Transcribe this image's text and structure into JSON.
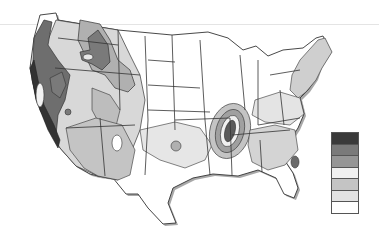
{
  "map": {
    "title": "",
    "subject": "Contiguous United States shaded hazard zones",
    "colors": {
      "zone7": "#3a3a3a",
      "zone6": "#7a7a7a",
      "zone5": "#969696",
      "zone4": "#f0f0f0",
      "zone3": "#c4c4c4",
      "zone2": "#e2e2e2",
      "zone1": "#ffffff",
      "outline": "#333333",
      "shadow": "#9a9a9a"
    }
  },
  "legend": {
    "swatches": [
      {
        "zone": "zone7",
        "color": "#3a3a3a"
      },
      {
        "zone": "zone6",
        "color": "#7a7a7a"
      },
      {
        "zone": "zone5",
        "color": "#969696"
      },
      {
        "zone": "zone4",
        "color": "#f0f0f0"
      },
      {
        "zone": "zone3",
        "color": "#c4c4c4"
      },
      {
        "zone": "zone2",
        "color": "#e2e2e2"
      },
      {
        "zone": "zone1",
        "color": "#ffffff"
      }
    ]
  }
}
